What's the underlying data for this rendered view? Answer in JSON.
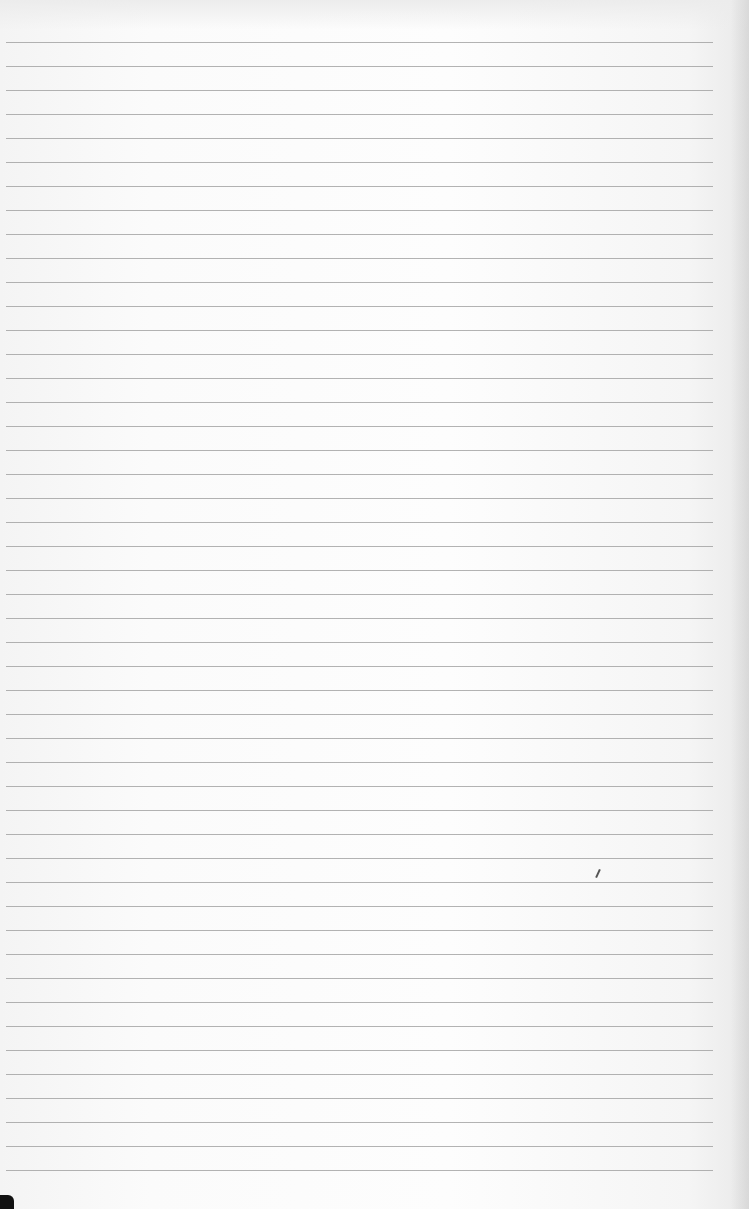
{
  "page": {
    "type": "lined-paper-photo",
    "background_color": "#fbfbfb",
    "rule_color": "#9a9a9a",
    "rule_count": 48,
    "first_rule_y": 42,
    "rule_spacing": 24,
    "text": ""
  }
}
